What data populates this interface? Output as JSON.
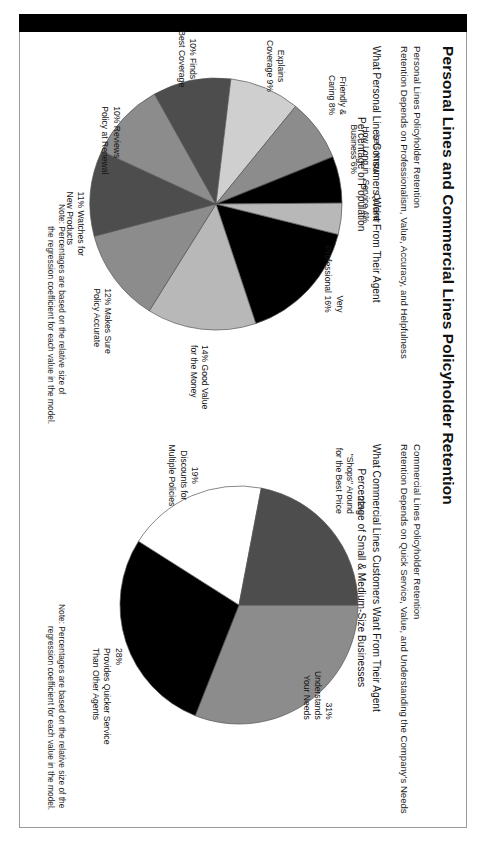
{
  "document": {
    "title": "Personal Lines and Commercial Lines Policyholder Retention",
    "left_column": {
      "heading_line1": "Personal Lines Policyholder Retention",
      "heading_line2": "Retention Depends on Professionalism, Value, Accuracy, and Helpfulness",
      "chart_title_line1": "What Personal Lines Consumers Want From Their Agent",
      "chart_title_line2": "Percentage of Population",
      "note_line1": "Note: Percentages are based on the relative size of",
      "note_line2": "the regression coefficient for each value in the model."
    },
    "right_column": {
      "heading_line1": "Commercial Lines Policyholder Retention",
      "heading_line2": "Retention Depends on Quick Service, Value, and Understanding the Company's Needs",
      "chart_title_line1": "What Commercial Lines Customers Want From Their Agent",
      "chart_title_line2": "Percentage of Small & Medium-Size Businesses",
      "note_line1": "Note: Percentages are based on the relative size of the",
      "note_line2": "regression coefficient for each value in the model."
    }
  },
  "colors": {
    "spine": "#000000",
    "frame": "#9a9a9a",
    "text": "#111111",
    "slice_black": "#000000",
    "slice_dark": "#4d4d4d",
    "slice_mid": "#8c8c8c",
    "slice_light": "#b8b8b8",
    "slice_lighter": "#cfcfcf",
    "slice_white": "#ffffff",
    "slice_outline": "#555555"
  },
  "chart_data": [
    {
      "type": "pie",
      "id": "personal-lines-pie",
      "title": "What Personal Lines Consumers Want From Their Agent",
      "subtitle": "Percentage of Population",
      "unit": "%",
      "total": 100,
      "legend": "callout-labels",
      "grid": false,
      "categories": [
        "Very Professional",
        "Good Value for the Money",
        "Makes Sure Policy Accurate",
        "Watches for New Products",
        "Reviews Policy at Renewal",
        "Finds Best Coverage",
        "Explains Coverage",
        "Friendly & Caring",
        "Lets Know How Long in Business",
        "Quicker Service"
      ],
      "values": [
        16,
        14,
        12,
        11,
        10,
        10,
        9,
        8,
        6,
        4
      ],
      "slice_colors": [
        "#000000",
        "#b8b8b8",
        "#8c8c8c",
        "#4d4d4d",
        "#8c8c8c",
        "#4d4d4d",
        "#cfcfcf",
        "#8c8c8c",
        "#000000",
        "#b8b8b8"
      ],
      "labels": [
        {
          "id": "very-professional",
          "pct": "16%",
          "lines": [
            "Very",
            "Professional 16%"
          ],
          "align": "right"
        },
        {
          "id": "good-value",
          "pct": "14%",
          "lines": [
            "14% Good Value",
            "for the Money"
          ],
          "align": "left"
        },
        {
          "id": "policy-accurate",
          "pct": "12%",
          "lines": [
            "12% Makes Sure",
            "Policy Accurate"
          ],
          "align": "left"
        },
        {
          "id": "new-products",
          "pct": "11%",
          "lines": [
            "11% Watches for",
            "New Products"
          ],
          "align": "left"
        },
        {
          "id": "reviews-at-renewal",
          "pct": "10%",
          "lines": [
            "10% Reviews",
            "Policy at Renewal"
          ],
          "align": "left"
        },
        {
          "id": "finds-best-coverage",
          "pct": "10%",
          "lines": [
            "10% Finds",
            "Best Coverage"
          ],
          "align": "center"
        },
        {
          "id": "explains-coverage",
          "pct": "9%",
          "lines": [
            "Explains",
            "Coverage 9%"
          ],
          "align": "center"
        },
        {
          "id": "friendly-caring",
          "pct": "8%",
          "lines": [
            "Friendly &",
            "Caring 8%"
          ],
          "align": "right"
        },
        {
          "id": "how-long-business",
          "pct": "6%",
          "lines": [
            "Lets Know",
            "How Long in",
            "Business 6%"
          ],
          "align": "right"
        },
        {
          "id": "quicker-service",
          "pct": "4%",
          "lines": [
            "Quicker",
            "Service 4%"
          ],
          "align": "right"
        }
      ]
    },
    {
      "type": "pie",
      "id": "commercial-lines-pie",
      "title": "What Commercial Lines Customers Want From Their Agent",
      "subtitle": "Percentage of Small & Medium-Size Businesses",
      "unit": "%",
      "total": 100,
      "legend": "callout-labels",
      "grid": false,
      "categories": [
        "Understands Your Needs",
        "Provides Quicker Service Than Other Agents",
        "Discounts for Multiple Policies",
        "\"Shops\" Around for the Best Price"
      ],
      "values": [
        31,
        28,
        19,
        22
      ],
      "slice_colors": [
        "#8c8c8c",
        "#000000",
        "#ffffff",
        "#4d4d4d"
      ],
      "labels": [
        {
          "id": "understands-needs",
          "pct": "31%",
          "lines": [
            "31%",
            "Understands",
            "Your Needs"
          ],
          "align": "right"
        },
        {
          "id": "quicker-service",
          "pct": "28%",
          "lines": [
            "28%",
            "Provides Quicker Service",
            "Than Other Agents"
          ],
          "align": "left"
        },
        {
          "id": "multiple-discounts",
          "pct": "19%",
          "lines": [
            "19%",
            "Discounts for",
            "Multiple Policies"
          ],
          "align": "center"
        },
        {
          "id": "shops-best-price",
          "pct": "22%",
          "lines": [
            "22%",
            "\"Shops\" Around",
            "for the Best Price"
          ],
          "align": "right"
        }
      ]
    }
  ]
}
